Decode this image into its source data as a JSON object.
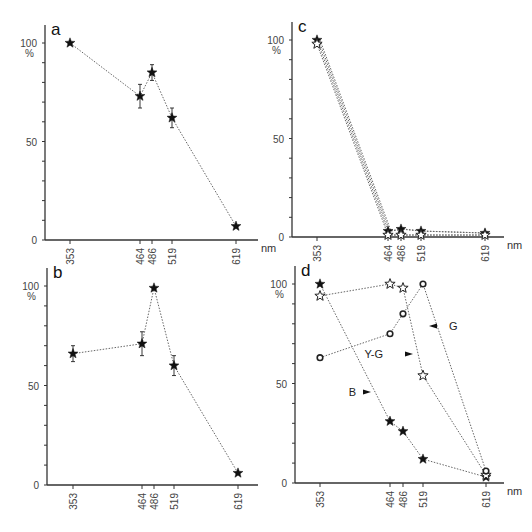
{
  "figure": {
    "x_unit": "nm",
    "y_unit": "%",
    "x_ticks": [
      353,
      464,
      486,
      519,
      619
    ],
    "y_ticks": [
      0,
      50,
      100
    ]
  },
  "chart_data": [
    {
      "panel": "a",
      "type": "line",
      "title": "a",
      "xlabel": "nm",
      "ylabel": "%",
      "x": [
        353,
        464,
        486,
        519,
        619
      ],
      "ylim": [
        0,
        100
      ],
      "grid": false,
      "series": [
        {
          "name": "a",
          "marker": "filled-star",
          "values": [
            100,
            73,
            85,
            62,
            7
          ],
          "error": [
            0,
            6,
            4,
            5,
            0
          ]
        }
      ]
    },
    {
      "panel": "b",
      "type": "line",
      "title": "b",
      "xlabel": "",
      "ylabel": "%",
      "x": [
        353,
        464,
        486,
        519,
        619
      ],
      "ylim": [
        0,
        100
      ],
      "grid": false,
      "series": [
        {
          "name": "b",
          "marker": "filled-star",
          "values": [
            66,
            71,
            99,
            60,
            6
          ],
          "error": [
            4,
            6,
            0,
            5,
            0
          ]
        }
      ]
    },
    {
      "panel": "c",
      "type": "line",
      "title": "c",
      "xlabel": "nm",
      "ylabel": "%",
      "x": [
        353,
        464,
        486,
        519,
        619
      ],
      "ylim": [
        0,
        100
      ],
      "grid": false,
      "series": [
        {
          "name": "filled",
          "marker": "filled-star",
          "values": [
            100,
            3,
            4,
            3,
            2
          ]
        },
        {
          "name": "open",
          "marker": "open-star",
          "values": [
            98,
            1,
            1,
            1,
            1
          ]
        }
      ]
    },
    {
      "panel": "d",
      "type": "line",
      "title": "d",
      "xlabel": "nm",
      "ylabel": "%",
      "x": [
        353,
        464,
        486,
        519,
        619
      ],
      "ylim": [
        0,
        100
      ],
      "grid": false,
      "annotations": [
        "B",
        "Y-G",
        "G"
      ],
      "series": [
        {
          "name": "B",
          "marker": "filled-star",
          "values": [
            100,
            31,
            26,
            12,
            3
          ]
        },
        {
          "name": "Y-G",
          "marker": "open-star",
          "values": [
            94,
            100,
            98,
            54,
            4
          ]
        },
        {
          "name": "G",
          "marker": "open-circle",
          "values": [
            63,
            75,
            85,
            100,
            6
          ]
        }
      ]
    }
  ]
}
